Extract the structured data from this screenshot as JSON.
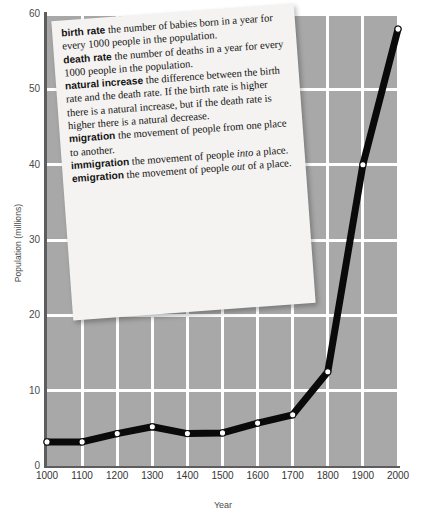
{
  "chart_data": {
    "type": "line",
    "title": "",
    "xlabel": "Year",
    "ylabel": "Population (millions)",
    "xlim": [
      1000,
      2000
    ],
    "ylim": [
      0,
      60
    ],
    "xticks": [
      1000,
      1100,
      1200,
      1300,
      1400,
      1500,
      1600,
      1700,
      1800,
      1900,
      2000
    ],
    "yticks": [
      0,
      10,
      20,
      30,
      40,
      50,
      60
    ],
    "grid": true,
    "legend": "none",
    "marker": "white-filled-circle",
    "line_color": "#000000",
    "plot_background": "#a8a8a8",
    "gridline_color": "#ffffff",
    "x": [
      1000,
      1100,
      1200,
      1300,
      1400,
      1500,
      1600,
      1700,
      1800,
      1900,
      2000
    ],
    "values": [
      3.2,
      3.2,
      4.3,
      5.2,
      4.3,
      4.4,
      5.7,
      6.8,
      12.5,
      40.0,
      58.0
    ],
    "series": [
      {
        "name": "Population",
        "values": [
          3.2,
          3.2,
          4.3,
          5.2,
          4.3,
          4.4,
          5.7,
          6.8,
          12.5,
          40.0,
          58.0
        ]
      }
    ]
  },
  "axes": {
    "y_label": "Population (millions)",
    "x_label": "Year",
    "y_tick_labels": [
      "0",
      "10",
      "20",
      "30",
      "40",
      "50",
      "60"
    ],
    "x_tick_labels": [
      "1000",
      "1100",
      "1200",
      "1300",
      "1400",
      "1500",
      "1600",
      "1700",
      "1800",
      "1900",
      "2000"
    ]
  },
  "definitions_card": {
    "entries": [
      {
        "term": "birth rate",
        "body": "the number of babies born in a year for every 1000 people in the population."
      },
      {
        "term": "death rate",
        "body": "the number of deaths in a year for every 1000 people in the population."
      },
      {
        "term": "natural increase",
        "body": "the difference between the birth rate and the death rate. If the birth rate is higher there is a natural increase, but if the death rate is higher there is a natural decrease."
      },
      {
        "term": "migration",
        "body": "the movement of people from one place to another."
      },
      {
        "term": "immigration",
        "body_pre": "the movement of people ",
        "body_em": "into",
        "body_post": " a place."
      },
      {
        "term": "emigration",
        "body_pre": "the movement of people ",
        "body_em": "out",
        "body_post": " of a place."
      }
    ]
  }
}
